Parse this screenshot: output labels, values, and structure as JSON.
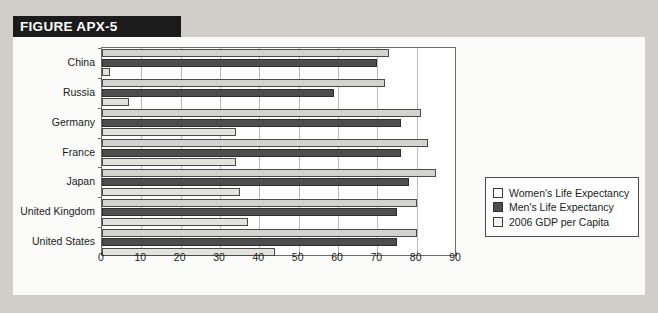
{
  "figure": {
    "banner_label": "FIGURE APX-5"
  },
  "legend": {
    "items": [
      {
        "label": "Women's Life Expectancy",
        "swatch": "women",
        "color": "#ffffff"
      },
      {
        "label": "Men's Life Expectancy",
        "swatch": "men",
        "color": "#4e4e4e"
      },
      {
        "label": "2006 GDP per Capita",
        "swatch": "gdp",
        "color": "#f2f2ef"
      }
    ]
  },
  "chart_data": {
    "type": "bar",
    "orientation": "horizontal",
    "title": "FIGURE APX-5",
    "xlabel": "",
    "ylabel": "",
    "xlim": [
      0,
      90
    ],
    "xticks": [
      0,
      10,
      20,
      30,
      40,
      50,
      60,
      70,
      80,
      90
    ],
    "grid": true,
    "legend_position": "right",
    "categories": [
      "China",
      "Russia",
      "Germany",
      "France",
      "Japan",
      "United Kingdom",
      "United States"
    ],
    "series": [
      {
        "name": "Women's Life Expectancy",
        "color": "#d3d3d0",
        "values": [
          73,
          72,
          81,
          83,
          85,
          80,
          80
        ]
      },
      {
        "name": "Men's Life Expectancy",
        "color": "#4e4e4e",
        "values": [
          70,
          59,
          76,
          76,
          78,
          75,
          75
        ]
      },
      {
        "name": "2006 GDP per Capita",
        "color": "#e2e2de",
        "values": [
          2,
          6.8,
          34,
          34,
          35,
          37,
          44
        ]
      }
    ]
  }
}
